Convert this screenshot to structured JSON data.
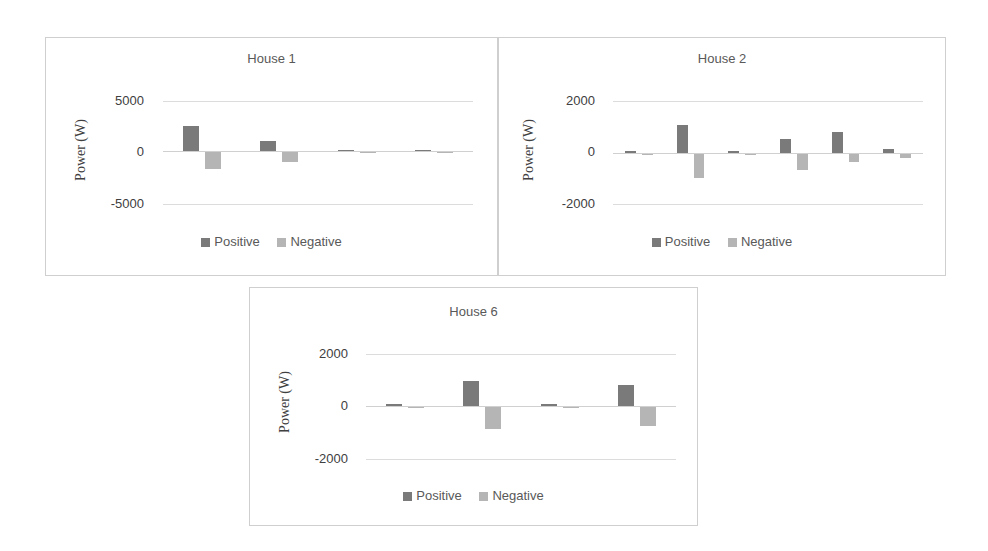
{
  "colors": {
    "positive": "#7a7a7a",
    "negative": "#b5b5b5",
    "grid": "#dcdcdc",
    "border": "#cfcfcf"
  },
  "legend": {
    "positive": "Positive",
    "negative": "Negative"
  },
  "ylabel": "Power (W)",
  "charts": [
    {
      "title": "House 1",
      "ticks": [
        "5000",
        "0",
        "-5000"
      ]
    },
    {
      "title": "House 2",
      "ticks": [
        "2000",
        "0",
        "-2000"
      ]
    },
    {
      "title": "House 6",
      "ticks": [
        "2000",
        "0",
        "-2000"
      ]
    }
  ],
  "chart_data": [
    {
      "type": "bar",
      "title": "House 1",
      "xlabel": "",
      "ylabel": "Power (W)",
      "ylim": [
        -5000,
        5000
      ],
      "yticks": [
        -5000,
        0,
        5000
      ],
      "grid": true,
      "legend_position": "bottom",
      "categories": [
        "1",
        "2",
        "3",
        "4"
      ],
      "series": [
        {
          "name": "Positive",
          "values": [
            2500,
            950,
            120,
            110
          ]
        },
        {
          "name": "Negative",
          "values": [
            -1650,
            -950,
            -40,
            -40
          ]
        }
      ]
    },
    {
      "type": "bar",
      "title": "House 2",
      "xlabel": "",
      "ylabel": "Power (W)",
      "ylim": [
        -2000,
        2000
      ],
      "yticks": [
        -2000,
        0,
        2000
      ],
      "grid": true,
      "legend_position": "bottom",
      "categories": [
        "1",
        "2",
        "3",
        "4",
        "5",
        "6"
      ],
      "series": [
        {
          "name": "Positive",
          "values": [
            90,
            1070,
            90,
            540,
            830,
            150
          ]
        },
        {
          "name": "Negative",
          "values": [
            -20,
            -940,
            -20,
            -630,
            -320,
            -140
          ]
        }
      ]
    },
    {
      "type": "bar",
      "title": "House 6",
      "xlabel": "",
      "ylabel": "Power (W)",
      "ylim": [
        -2000,
        2000
      ],
      "yticks": [
        -2000,
        0,
        2000
      ],
      "grid": true,
      "legend_position": "bottom",
      "categories": [
        "1",
        "2",
        "3",
        "4"
      ],
      "series": [
        {
          "name": "Positive",
          "values": [
            70,
            960,
            70,
            790
          ]
        },
        {
          "name": "Negative",
          "values": [
            -30,
            -850,
            -30,
            -720
          ]
        }
      ]
    }
  ]
}
